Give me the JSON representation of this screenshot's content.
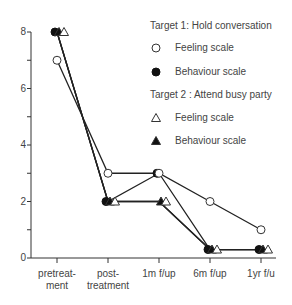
{
  "chart_data": {
    "type": "line",
    "title": "",
    "xlabel": "",
    "ylabel": "",
    "ylim": [
      0,
      8
    ],
    "y_ticks": [
      "0",
      "2",
      "4",
      "6",
      "8"
    ],
    "categories": [
      "pretreat-ment",
      "post-treatment",
      "1m f/up",
      "6m f/up",
      "1yr f/u"
    ],
    "category_lines": [
      [
        "pretreat-",
        "ment"
      ],
      [
        "post-",
        "treatment"
      ],
      [
        "1m f/up",
        ""
      ],
      [
        "6m f/up",
        ""
      ],
      [
        "1yr f/u",
        ""
      ]
    ],
    "legend": {
      "group1_title": "Target 1: Hold conversation",
      "group2_title": "Target 2 : Attend busy party",
      "entries": [
        {
          "label": "Feeling scale",
          "marker": "open-circle"
        },
        {
          "label": "Behaviour scale",
          "marker": "filled-circle"
        },
        {
          "label": "Feeling scale",
          "marker": "open-triangle"
        },
        {
          "label": "Behaviour scale",
          "marker": "filled-triangle"
        }
      ]
    },
    "series": [
      {
        "name": "Target 1: Feeling scale",
        "marker": "open-circle",
        "values": [
          7,
          3,
          3,
          2,
          1
        ]
      },
      {
        "name": "Target 1: Behaviour scale",
        "marker": "filled-circle",
        "values": [
          8,
          2,
          3,
          0.3,
          0.3
        ]
      },
      {
        "name": "Target 2: Feeling scale",
        "marker": "open-triangle",
        "values": [
          8,
          2,
          2,
          0.3,
          0.3
        ]
      },
      {
        "name": "Target 2: Behaviour scale",
        "marker": "filled-triangle",
        "values": [
          8,
          2,
          2,
          0.3,
          0.3
        ]
      }
    ]
  }
}
